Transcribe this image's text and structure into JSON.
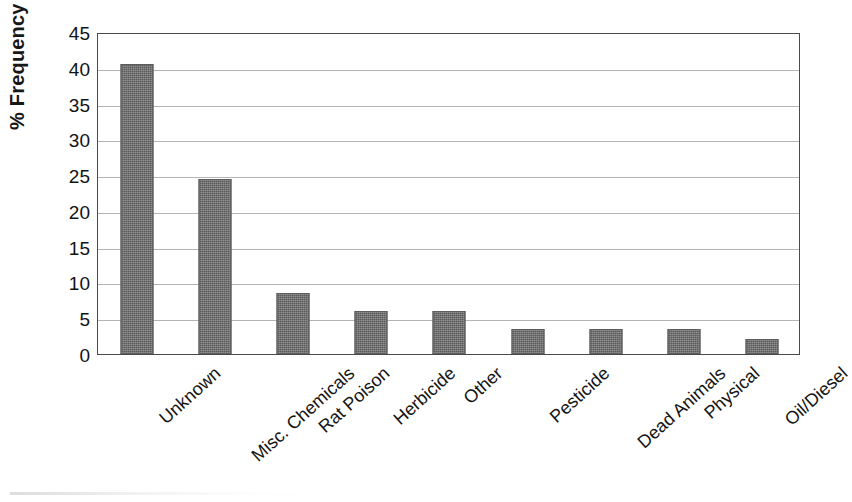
{
  "chart_data": {
    "type": "bar",
    "title": "",
    "xlabel": "",
    "ylabel": "% Frequency",
    "ylim": [
      0,
      45
    ],
    "yticks": [
      0,
      5,
      10,
      15,
      20,
      25,
      30,
      35,
      40,
      45
    ],
    "grid": true,
    "legend": "none",
    "bar_color": "#6f6f6f",
    "categories": [
      "Unknown",
      "Misc. Chemicals",
      "Rat Poison",
      "Herbicide",
      "Other",
      "Pesticide",
      "Dead Animals",
      "Physical",
      "Oil/Diesel"
    ],
    "values": [
      40.5,
      24.5,
      8.5,
      6.0,
      6.0,
      3.5,
      3.5,
      3.5,
      2.1
    ]
  }
}
